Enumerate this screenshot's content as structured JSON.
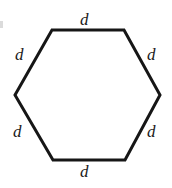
{
  "figure": {
    "type": "regular-hexagon",
    "background_color": "#ffffff",
    "stroke_color": "#161616",
    "stroke_width": 3,
    "label_color": "#1a1a1a",
    "vertices": [
      {
        "name": "top-left",
        "x": 52,
        "y": 30
      },
      {
        "name": "top-right",
        "x": 124,
        "y": 30
      },
      {
        "name": "right",
        "x": 160,
        "y": 95
      },
      {
        "name": "bottom-right",
        "x": 125,
        "y": 160
      },
      {
        "name": "bottom-left",
        "x": 53,
        "y": 160
      },
      {
        "name": "left",
        "x": 15,
        "y": 95
      }
    ],
    "labels": [
      {
        "side": "top",
        "text": "d"
      },
      {
        "side": "upper-left",
        "text": "d"
      },
      {
        "side": "upper-right",
        "text": "d"
      },
      {
        "side": "lower-left",
        "text": "d"
      },
      {
        "side": "lower-right",
        "text": "d"
      },
      {
        "side": "bottom",
        "text": "d"
      }
    ]
  }
}
